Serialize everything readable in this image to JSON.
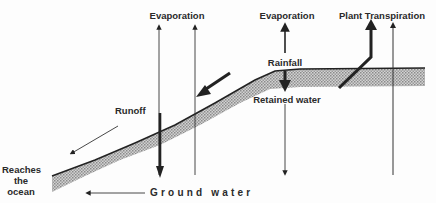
{
  "diagram": {
    "labels": {
      "evaporation_left": "Evaporation",
      "evaporation_right": "Evaporation",
      "plant_transpiration": "Plant Transpiration",
      "rainfall": "Rainfall",
      "retained_water": "Retained water",
      "runoff": "Runoff",
      "reaches_line1": "Reaches",
      "reaches_line2": "the",
      "reaches_line3": "ocean",
      "ground_water": "Ground water"
    },
    "colors": {
      "ink": "#222222",
      "soil_fill": "#b8b8b8",
      "background": "#fdfdfd"
    }
  }
}
